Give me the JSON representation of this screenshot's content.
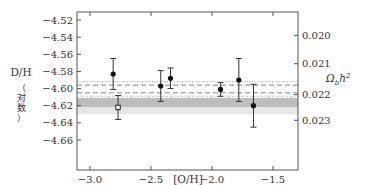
{
  "chart_data": {
    "type": "scatter",
    "title": "",
    "xlabel": "[O/H]",
    "ylabel": "D/H (对数)",
    "ylabel_parts": {
      "main": "D/H",
      "sub": "（对数）"
    },
    "y2label": "Ω_b h²",
    "xlim": [
      -3.1,
      -1.35
    ],
    "ylim": [
      -4.665,
      -4.515
    ],
    "x_ticks": [
      -3.0,
      -2.5,
      -2.0,
      -1.5
    ],
    "x_tick_labels": [
      "−3.0",
      "−2.5",
      "−2.0",
      "−1.5"
    ],
    "y_ticks": [
      -4.52,
      -4.54,
      -4.56,
      -4.58,
      -4.6,
      -4.62,
      -4.64,
      -4.66
    ],
    "y_tick_labels": [
      "−4.52",
      "−4.54",
      "−4.56",
      "−4.58",
      "−4.60",
      "−4.62",
      "−4.64",
      "−4.66"
    ],
    "y2_ticks": [
      0.02,
      0.021,
      0.022,
      0.023
    ],
    "y2_tick_labels": [
      "0.020",
      "0.021",
      "0.022",
      "0.023"
    ],
    "y2_tick_positions_y": [
      -4.538,
      -4.571,
      -4.607,
      -4.637
    ],
    "grid": false,
    "legend": null,
    "series": [
      {
        "name": "measurements (filled)",
        "marker": "filled-circle",
        "points": [
          {
            "x": -2.81,
            "y": -4.583,
            "err": 0.018
          },
          {
            "x": -2.42,
            "y": -4.597,
            "err": 0.018
          },
          {
            "x": -2.34,
            "y": -4.588,
            "err": 0.012
          },
          {
            "x": -1.93,
            "y": -4.601,
            "err": 0.008
          },
          {
            "x": -1.78,
            "y": -4.59,
            "err": 0.025
          },
          {
            "x": -1.66,
            "y": -4.62,
            "err": 0.025
          }
        ]
      },
      {
        "name": "measurement (open)",
        "marker": "open-square",
        "points": [
          {
            "x": -2.77,
            "y": -4.622,
            "err": 0.014
          }
        ]
      }
    ],
    "reference_lines": [
      {
        "style": "dotted",
        "y": -4.592,
        "color": "#999999"
      },
      {
        "style": "dashed",
        "y": -4.596,
        "color": "#777777"
      },
      {
        "style": "dashed",
        "y": -4.605,
        "color": "#777777"
      },
      {
        "style": "dotted",
        "y": -4.609,
        "color": "#999999"
      }
    ],
    "bands": [
      {
        "name": "inner band",
        "y_from": -4.611,
        "y_to": -4.622,
        "color": "#bdbdbd"
      },
      {
        "name": "outer band",
        "y_from": -4.622,
        "y_to": -4.63,
        "color": "#e6e6e6"
      }
    ]
  }
}
